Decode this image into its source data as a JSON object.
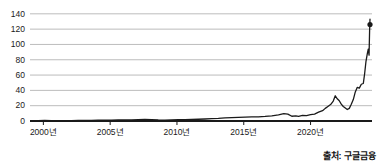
{
  "source_note": "출처: 구글금융",
  "chart_data": {
    "type": "line",
    "title": "",
    "subtitle": "",
    "xlabel": "",
    "ylabel": "",
    "grid": true,
    "legend": null,
    "xlim": [
      1999.0,
      2024.6
    ],
    "ylim": [
      0,
      145
    ],
    "y_ticks": [
      0,
      20,
      40,
      60,
      80,
      100,
      120,
      140
    ],
    "y_tick_labels": [
      "0",
      "20",
      "40",
      "60",
      "80",
      "100",
      "120",
      "140"
    ],
    "x_ticks": [
      2000,
      2005,
      2010,
      2015,
      2020
    ],
    "x_tick_labels": [
      "2000년",
      "2005년",
      "2010년",
      "2015년",
      "2020년"
    ],
    "line_color": "#1a1a1a",
    "grid_color": "#b4b4b4",
    "axis_color": "#1a1a1a",
    "end_marker": {
      "x": 2024.45,
      "y": 126,
      "shape": "circle"
    },
    "series": [
      {
        "name": "주가",
        "x": [
          1999.1,
          1999.6,
          2000.1,
          2000.6,
          2001.1,
          2001.6,
          2002.1,
          2002.6,
          2003.1,
          2003.6,
          2004.1,
          2004.6,
          2005.1,
          2005.6,
          2006.1,
          2006.6,
          2007.1,
          2007.6,
          2008.1,
          2008.6,
          2009.1,
          2009.6,
          2010.1,
          2010.6,
          2011.1,
          2011.6,
          2012.1,
          2012.6,
          2013.1,
          2013.6,
          2014.1,
          2014.6,
          2015.1,
          2015.6,
          2016.1,
          2016.6,
          2017.1,
          2017.6,
          2018.0,
          2018.3,
          2018.6,
          2018.9,
          2019.1,
          2019.4,
          2019.7,
          2020.0,
          2020.3,
          2020.6,
          2020.9,
          2021.1,
          2021.3,
          2021.5,
          2021.7,
          2021.85,
          2022.0,
          2022.15,
          2022.3,
          2022.45,
          2022.6,
          2022.75,
          2022.9,
          2023.05,
          2023.2,
          2023.35,
          2023.5,
          2023.65,
          2023.8,
          2023.95,
          2024.05,
          2024.15,
          2024.25,
          2024.32,
          2024.38,
          2024.42,
          2024.45
        ],
        "y": [
          0.5,
          0.6,
          0.7,
          0.6,
          0.5,
          0.5,
          0.6,
          0.7,
          0.8,
          0.9,
          1.0,
          1.1,
          1.2,
          1.3,
          1.5,
          1.6,
          1.8,
          2.0,
          1.9,
          1.4,
          1.2,
          1.6,
          1.8,
          1.9,
          2.1,
          2.3,
          2.6,
          3.0,
          3.4,
          4.0,
          4.4,
          4.8,
          5.0,
          5.3,
          5.4,
          6.0,
          6.8,
          8.0,
          9.6,
          9.0,
          6.2,
          6.6,
          6.0,
          7.2,
          7.0,
          8.2,
          9.0,
          11.5,
          13.5,
          16.5,
          19.0,
          21.5,
          26.0,
          33.0,
          29.0,
          26.5,
          22.0,
          19.0,
          17.0,
          15.0,
          16.5,
          22.0,
          28.0,
          38.0,
          44.0,
          43.0,
          48.0,
          49.0,
          62.0,
          78.0,
          88.0,
          94.0,
          86.0,
          118.0,
          133.0
        ]
      }
    ]
  }
}
